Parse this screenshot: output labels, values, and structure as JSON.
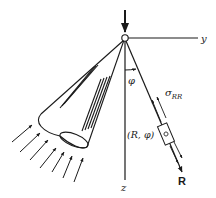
{
  "diagram": {
    "type": "boussinesq-point-load-stress",
    "labels": {
      "y_axis": "y",
      "z_axis": "z",
      "angle": "φ",
      "stress_main": "σ",
      "stress_sub": "RR",
      "point_coords": "(R, φ)",
      "ray": "R"
    },
    "colors": {
      "stroke": "#1a1a1a",
      "background": "#ffffff"
    }
  }
}
